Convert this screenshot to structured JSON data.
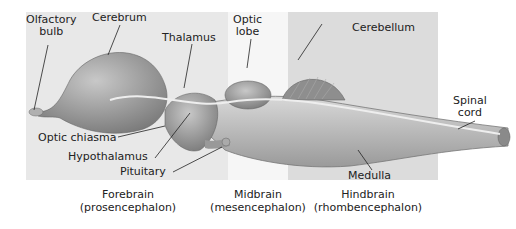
{
  "labels": {
    "olfactory_bulb": [
      "Olfactory",
      "bulb"
    ],
    "cerebrum": "Cerebrum",
    "thalamus": "Thalamus",
    "optic_lobe": [
      "Optic",
      "lobe"
    ],
    "cerebellum": "Cerebellum",
    "spinal_cord": [
      "Spinal",
      "cord"
    ],
    "optic_chiasma": "Optic chiasma",
    "hypothalamus": "Hypothalamus",
    "pituitary": "Pituitary",
    "medulla": "Medulla"
  },
  "regions": [
    {
      "name": "Forebrain",
      "latin": "(prosencephalon)"
    },
    {
      "name": "Midbrain",
      "latin": "(mesencephalon)"
    },
    {
      "name": "Hindbrain",
      "latin": "(rhombencephalon)"
    }
  ],
  "colors": {
    "forebrain_panel": "#e8e8e8",
    "midbrain_panel": "#f6f6f6",
    "hindbrain_panel": "#dcdcdc",
    "brain_fill": "#9a9a9a",
    "text": "#222222"
  }
}
